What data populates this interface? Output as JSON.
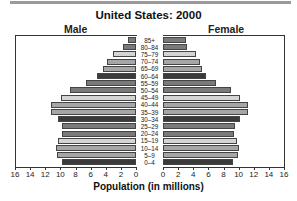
{
  "chart_data": {
    "type": "bar",
    "subtype": "population-pyramid",
    "title": "United States: 2000",
    "xlabel": "Population (in millions)",
    "ylabel": "",
    "legend": [
      "Male",
      "Female"
    ],
    "xlim": [
      0,
      16
    ],
    "x_ticks": [
      0,
      2,
      4,
      6,
      8,
      10,
      12,
      14,
      16
    ],
    "grid": false,
    "categories": [
      "85+",
      "80–84",
      "75–79",
      "70–74",
      "65–69",
      "60–64",
      "55–59",
      "50–54",
      "45–49",
      "40–44",
      "35–39",
      "30–34",
      "25–29",
      "20–24",
      "15–19",
      "10–14",
      "5–9",
      "0–4"
    ],
    "series": [
      {
        "name": "Male",
        "values": [
          1.1,
          1.7,
          3.0,
          3.8,
          4.4,
          5.2,
          6.6,
          8.7,
          9.9,
          11.2,
          11.3,
          10.3,
          9.8,
          9.8,
          10.3,
          10.6,
          10.5,
          9.8
        ]
      },
      {
        "name": "Female",
        "values": [
          3.0,
          3.2,
          4.4,
          4.9,
          5.2,
          5.7,
          7.0,
          9.0,
          10.2,
          11.3,
          11.3,
          10.2,
          9.5,
          9.4,
          9.8,
          10.1,
          9.9,
          9.3
        ]
      }
    ],
    "shades": [
      "#7a7a7a",
      "#7a7a7a",
      "#d4d4d4",
      "#a6a6a6",
      "#a6a6a6",
      "#3a3a3a"
    ]
  },
  "labels": {
    "title": "United States: 2000",
    "male": "Male",
    "female": "Female",
    "xlabel": "Population (in millions)"
  }
}
